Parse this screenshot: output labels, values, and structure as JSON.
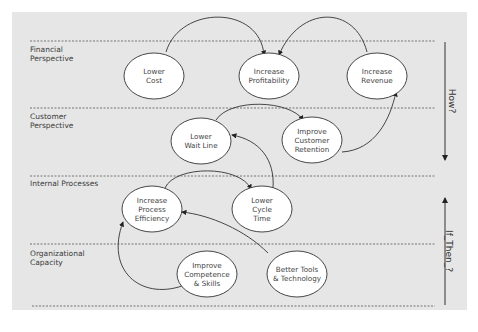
{
  "diagram": {
    "type": "strategy-map",
    "colors": {
      "background": "#e6e6e6",
      "node_fill": "#ffffff",
      "stroke": "#333333",
      "text": "#444444"
    },
    "perspectives": [
      {
        "id": "financial",
        "label": "Financial\nPerspective"
      },
      {
        "id": "customer",
        "label": "Customer\nPerspective"
      },
      {
        "id": "internal",
        "label": "Internal Processes"
      },
      {
        "id": "organizational",
        "label": "Organizational\nCapacity"
      }
    ],
    "nodes": [
      {
        "id": "lower-cost",
        "label": "Lower\nCost",
        "perspective": "financial"
      },
      {
        "id": "increase-profitability",
        "label": "Increase\nProfitability",
        "perspective": "financial"
      },
      {
        "id": "increase-revenue",
        "label": "Increase\nRevenue",
        "perspective": "financial"
      },
      {
        "id": "lower-wait-line",
        "label": "Lower\nWait Line",
        "perspective": "customer"
      },
      {
        "id": "improve-customer-retention",
        "label": "Improve\nCustomer\nRetention",
        "perspective": "customer"
      },
      {
        "id": "increase-process-efficiency",
        "label": "Increase\nProcess\nEfficiency",
        "perspective": "internal"
      },
      {
        "id": "lower-cycle-time",
        "label": "Lower\nCycle\nTime",
        "perspective": "internal"
      },
      {
        "id": "improve-competence-skills",
        "label": "Improve\nCompetence\n& Skills",
        "perspective": "organizational"
      },
      {
        "id": "better-tools-technology",
        "label": "Better Tools\n& Technology",
        "perspective": "organizational"
      }
    ],
    "edges": [
      {
        "from": "lower-cost",
        "to": "increase-profitability"
      },
      {
        "from": "increase-revenue",
        "to": "increase-profitability"
      },
      {
        "from": "lower-wait-line",
        "to": "improve-customer-retention"
      },
      {
        "from": "improve-customer-retention",
        "to": "increase-revenue"
      },
      {
        "from": "lower-cycle-time",
        "to": "lower-wait-line"
      },
      {
        "from": "increase-process-efficiency",
        "to": "lower-cycle-time"
      },
      {
        "from": "better-tools-technology",
        "to": "increase-process-efficiency"
      },
      {
        "from": "improve-competence-skills",
        "to": "increase-process-efficiency"
      }
    ],
    "side_arrows": [
      {
        "label": "How?",
        "direction": "down"
      },
      {
        "label": "If_Then_?",
        "direction": "up"
      }
    ]
  }
}
